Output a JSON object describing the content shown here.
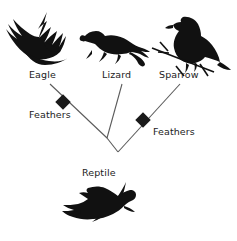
{
  "figure": {
    "kind": "cladogram",
    "background": "#ffffff",
    "line_color": "#5a5a5a",
    "node_color": "#1a1a1a",
    "text_color": "#1c1c1c"
  },
  "taxa": [
    {
      "id": "eagle",
      "label": "Eagle",
      "icon": "flying-eagle-silhouette"
    },
    {
      "id": "lizard",
      "label": "Lizard",
      "icon": "lizard-silhouette"
    },
    {
      "id": "sparrow",
      "label": "Sparrow",
      "icon": "perched-sparrow-silhouette"
    }
  ],
  "trait_nodes": [
    {
      "id": "feathers-left",
      "label": "Feathers",
      "marker": "diamond"
    },
    {
      "id": "feathers-right",
      "label": "Feathers",
      "marker": "diamond"
    }
  ],
  "root": {
    "id": "reptile",
    "label": "Reptile",
    "icon": "crocodile-silhouette"
  }
}
